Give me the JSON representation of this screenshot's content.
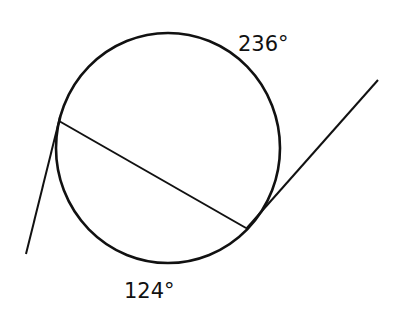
{
  "diagram": {
    "stroke_color": "#111111",
    "background": "#ffffff",
    "circle": {
      "cx": 168,
      "cy": 148,
      "rx": 112,
      "ry": 115
    },
    "chord": {
      "x1": 59,
      "y1": 121,
      "x2": 246,
      "y2": 228
    },
    "tangent_left": {
      "x1": 60,
      "y1": 117,
      "x2": 26,
      "y2": 254
    },
    "tangent_right": {
      "x1": 378,
      "y1": 80,
      "x2": 246,
      "y2": 229
    },
    "labels": {
      "major_arc": "236°",
      "minor_arc": "124°"
    }
  }
}
